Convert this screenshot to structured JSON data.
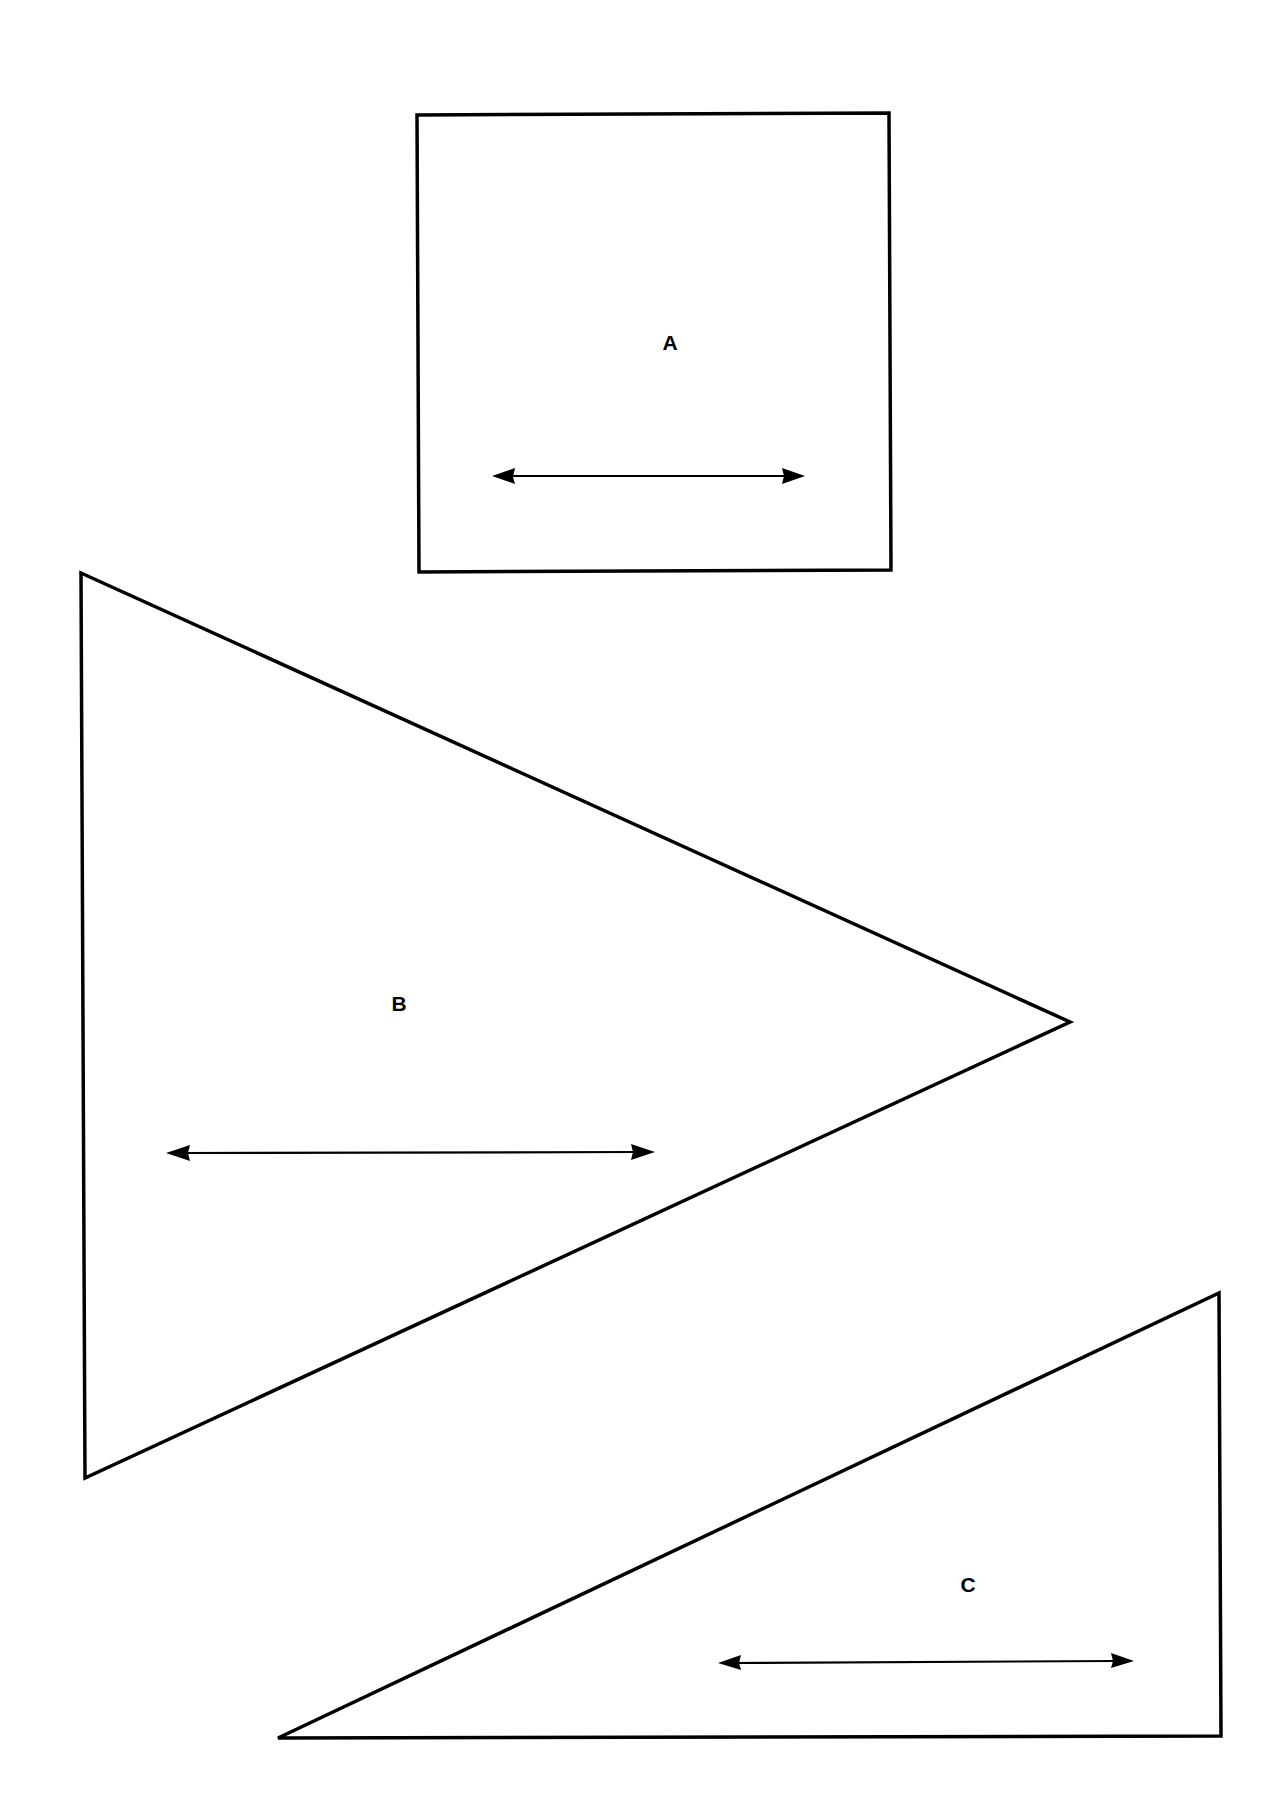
{
  "diagram": {
    "background": "#ffffff",
    "stroke_color": "#000000",
    "shapes": [
      {
        "id": "A",
        "type": "rectangle",
        "label": "A",
        "points": "417,115 889,113 891,570 419,572",
        "label_pos": [
          670,
          350
        ],
        "arrow": {
          "x1": 492,
          "x2": 805,
          "y": 476
        }
      },
      {
        "id": "B",
        "type": "triangle",
        "label": "B",
        "points": "81,573 1070,1022 85,1478",
        "label_pos": [
          399,
          1011
        ],
        "arrow": {
          "x1": 166,
          "x2": 655,
          "y": 1153
        }
      },
      {
        "id": "C",
        "type": "right-triangle",
        "label": "C",
        "points": "1219,1293 1221,1736 278,1738",
        "label_pos": [
          968,
          1592
        ],
        "arrow": {
          "x1": 718,
          "x2": 1134,
          "y": 1662
        }
      }
    ]
  }
}
